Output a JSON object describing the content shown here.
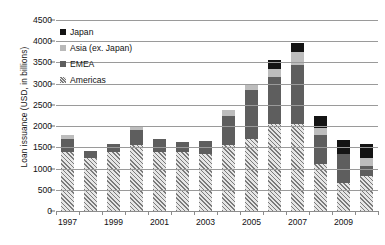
{
  "chart_data": {
    "type": "bar",
    "stacked": true,
    "title": "",
    "xlabel": "",
    "ylabel": "Loan issuance (USD, in billions)",
    "ylim": [
      0,
      4500
    ],
    "ytick_step": 500,
    "yticks": [
      "4500",
      "4000",
      "3500",
      "3000",
      "2500",
      "2000",
      "1500",
      "1000",
      "500",
      "0"
    ],
    "grid": true,
    "legend_position": "upper-left-inside",
    "categories": [
      "1997",
      "1998",
      "1999",
      "2000",
      "2001",
      "2002",
      "2003",
      "2004",
      "2005",
      "2006",
      "2007",
      "2008",
      "2009",
      "2010"
    ],
    "xtick_labels_shown": [
      "1997",
      "1999",
      "2001",
      "2003",
      "2005",
      "2007",
      "2009"
    ],
    "series": [
      {
        "name": "Americas",
        "marker": "hatched-square",
        "color": "#d8d8d8",
        "values": [
          1400,
          1250,
          1400,
          1550,
          1400,
          1380,
          1350,
          1550,
          1700,
          2050,
          2050,
          1100,
          650,
          830
        ]
      },
      {
        "name": "EMEA",
        "marker": "dark-gray-square",
        "color": "#5e5e5e",
        "values": [
          300,
          170,
          170,
          350,
          300,
          250,
          300,
          700,
          1150,
          1100,
          1400,
          700,
          700,
          230
        ]
      },
      {
        "name": "Asia (ex. Japan)",
        "marker": "light-gray-square",
        "color": "#bdbdbd",
        "values": [
          80,
          0,
          0,
          80,
          0,
          0,
          0,
          130,
          130,
          200,
          300,
          150,
          0,
          200
        ]
      },
      {
        "name": "Japan",
        "marker": "black-square",
        "color": "#141414",
        "values": [
          0,
          0,
          0,
          0,
          0,
          0,
          0,
          0,
          0,
          200,
          200,
          280,
          320,
          320
        ]
      }
    ],
    "totals": [
      1780,
      1420,
      1570,
      1980,
      1700,
      1630,
      1650,
      2380,
      2980,
      3550,
      3950,
      2230,
      1670,
      1580
    ]
  },
  "legend": {
    "items": [
      {
        "label": "Japan",
        "swatch": "black-square"
      },
      {
        "label": "Asia (ex. Japan)",
        "swatch": "light-gray-square"
      },
      {
        "label": "EMEA",
        "swatch": "dark-gray-square"
      },
      {
        "label": "Americas",
        "swatch": "hatched-square"
      }
    ]
  },
  "axes": {
    "y_title": "Loan issuance (USD, in billions)"
  }
}
